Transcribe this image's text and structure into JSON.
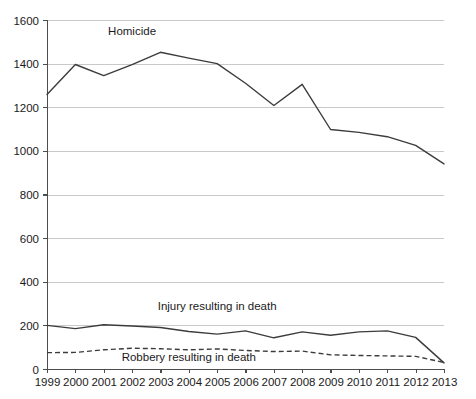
{
  "chart_data": {
    "type": "line",
    "title": "",
    "xlabel": "",
    "ylabel": "",
    "grid": true,
    "legend_position": "inline-annotation",
    "ylim": [
      0,
      1600
    ],
    "ytick_values": [
      0,
      200,
      400,
      600,
      800,
      1000,
      1200,
      1400,
      1600
    ],
    "ytick_labels": [
      "0",
      "200",
      "400",
      "600",
      "800",
      "1000",
      "1200",
      "1400",
      "1600"
    ],
    "categories": [
      "1999",
      "2000",
      "2001",
      "2002",
      "2003",
      "2004",
      "2005",
      "2006",
      "2007",
      "2008",
      "2009",
      "2010",
      "2011",
      "2012",
      "2013"
    ],
    "series": [
      {
        "name": "Homicide",
        "style": "solid",
        "color": "#3c3c3c",
        "values": [
          1258,
          1396,
          1345,
          1395,
          1452,
          1425,
          1400,
          1310,
          1208,
          1305,
          1098,
          1085,
          1065,
          1025,
          940
        ]
      },
      {
        "name": "Injury resulting in death",
        "style": "solid",
        "color": "#3c3c3c",
        "values": [
          200,
          185,
          203,
          197,
          190,
          172,
          160,
          175,
          143,
          170,
          155,
          170,
          175,
          145,
          28
        ]
      },
      {
        "name": "Robbery resulting in death",
        "style": "dashed",
        "color": "#3c3c3c",
        "values": [
          75,
          76,
          88,
          95,
          93,
          88,
          92,
          85,
          80,
          82,
          65,
          62,
          60,
          58,
          30
        ]
      }
    ],
    "annotations": [
      {
        "text": "Homicide",
        "x_category": "2002",
        "y_value": 1530
      },
      {
        "text": "Injury resulting in death",
        "x_category": "2005",
        "y_value": 270
      },
      {
        "text": "Robbery resulting in death",
        "x_category": "2004",
        "y_value": 38
      }
    ]
  }
}
